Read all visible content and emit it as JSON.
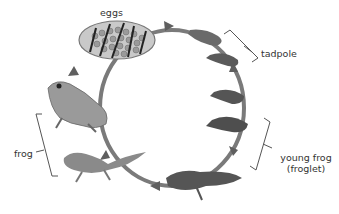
{
  "diagram": {
    "type": "life-cycle",
    "subject": "frog",
    "stages": [
      {
        "id": "eggs",
        "label": "eggs"
      },
      {
        "id": "tadpole",
        "label": "tadpole"
      },
      {
        "id": "young-frog",
        "label": "young frog",
        "sublabel": "(froglet)"
      },
      {
        "id": "frog",
        "label": "frog"
      }
    ],
    "colors": {
      "arrow": "#6f6f6f",
      "bracket": "#555555",
      "text": "#333333"
    }
  }
}
